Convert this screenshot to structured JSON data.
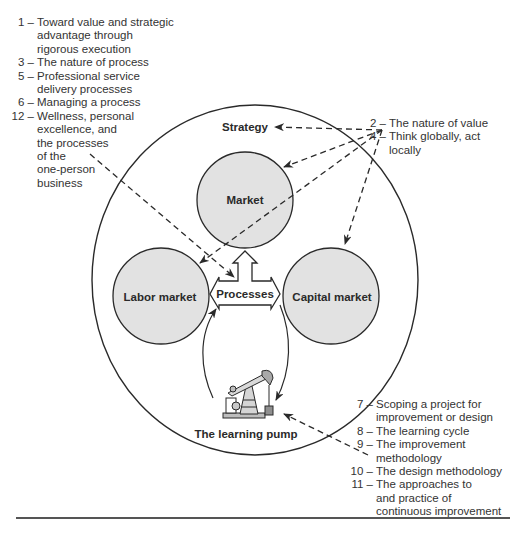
{
  "diagram": {
    "outer_circle_label": "Strategy",
    "nodes": {
      "market": "Market",
      "labor_market": "Labor market",
      "capital_market": "Capital market",
      "processes": "Processes",
      "pump": "The learning pump"
    },
    "colors": {
      "node_fill": "#e2e2e2",
      "stroke": "#2a2a2a",
      "text": "#2a2a2a",
      "background": "#ffffff"
    }
  },
  "notes_top_left": [
    {
      "num": "1 –",
      "lines": [
        "Toward value and strategic",
        "advantage through",
        "rigorous execution"
      ]
    },
    {
      "num": "3 –",
      "lines": [
        "The nature of process"
      ]
    },
    {
      "num": "5 –",
      "lines": [
        "Professional service",
        "delivery processes"
      ]
    },
    {
      "num": "6 –",
      "lines": [
        "Managing a process"
      ]
    },
    {
      "num": "12 –",
      "lines": [
        "Wellness, personal",
        "excellence, and",
        "the processes",
        "of the",
        "one-person",
        "business"
      ]
    }
  ],
  "notes_top_right": [
    {
      "num": "2 –",
      "lines": [
        "The nature of value"
      ]
    },
    {
      "num": "4 –",
      "lines": [
        "Think globally, act",
        "locally"
      ]
    }
  ],
  "notes_bottom_right": [
    {
      "num": "7 –",
      "lines": [
        "Scoping a project for",
        "improvement or design"
      ]
    },
    {
      "num": "8 –",
      "lines": [
        "The learning cycle"
      ]
    },
    {
      "num": "9 –",
      "lines": [
        "The improvement",
        "methodology"
      ]
    },
    {
      "num": "10 –",
      "lines": [
        "The design methodology"
      ]
    },
    {
      "num": "11 –",
      "lines": [
        "The approaches to",
        "and practice of",
        "continuous improvement"
      ]
    }
  ]
}
